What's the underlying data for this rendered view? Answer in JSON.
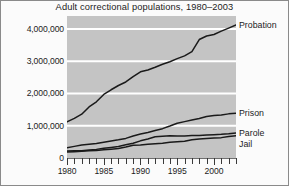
{
  "chart_data": {
    "type": "line",
    "title": "Adult correctional populations, 1980–2003",
    "xlabel": "",
    "ylabel": "",
    "xlim": [
      1980,
      2003
    ],
    "ylim": [
      0,
      4400000
    ],
    "grid": true,
    "gridlines_color": "#ffffff",
    "plot_background": "#c4c4c4",
    "line_color": "#1a1a1a",
    "legend_position": "right-inline",
    "x": [
      1980,
      1981,
      1982,
      1983,
      1984,
      1985,
      1986,
      1987,
      1988,
      1989,
      1990,
      1991,
      1992,
      1993,
      1994,
      1995,
      1996,
      1997,
      1998,
      1999,
      2000,
      2001,
      2002,
      2003
    ],
    "y_ticks": [
      0,
      1000000,
      2000000,
      3000000,
      4000000
    ],
    "y_tick_labels": [
      "0",
      "1,000,000",
      "2,000,000",
      "3,000,000",
      "4,000,000"
    ],
    "x_ticks": [
      1980,
      1985,
      1990,
      1995,
      2000
    ],
    "x_tick_labels": [
      "1980",
      "1985",
      "1990",
      "1995",
      "2000"
    ],
    "series": [
      {
        "name": "Probation",
        "label": "Probation",
        "values": [
          1118097,
          1225934,
          1357264,
          1582947,
          1740948,
          1968712,
          2114621,
          2247158,
          2356483,
          2522125,
          2670234,
          2728472,
          2811611,
          2903061,
          2981022,
          3077861,
          3164996,
          3296513,
          3670441,
          3779922,
          3826209,
          3931731,
          4024067,
          4120012
        ]
      },
      {
        "name": "Prison",
        "label": "Prison",
        "values": [
          319598,
          360029,
          402914,
          423898,
          448264,
          487593,
          526436,
          562814,
          607766,
          683367,
          743382,
          792535,
          850566,
          909381,
          990147,
          1078542,
          1127528,
          1176564,
          1224469,
          1287172,
          1316333,
          1330007,
          1367547,
          1387266
        ]
      },
      {
        "name": "Parole",
        "label": "Parole",
        "values": [
          220438,
          225539,
          224604,
          246440,
          266992,
          300203,
          325638,
          355505,
          407977,
          456803,
          531407,
          590442,
          658601,
          676100,
          690371,
          679421,
          679733,
          694787,
          696385,
          714457,
          723898,
          732333,
          750934,
          774588
        ]
      },
      {
        "name": "Jail",
        "label": "Jail",
        "values": [
          183988,
          196785,
          209582,
          223551,
          234500,
          256615,
          274444,
          295873,
          341893,
          393303,
          405320,
          426479,
          444584,
          459804,
          486474,
          507044,
          518492,
          567079,
          592462,
          605943,
          621149,
          631240,
          665475,
          691301
        ]
      }
    ]
  }
}
